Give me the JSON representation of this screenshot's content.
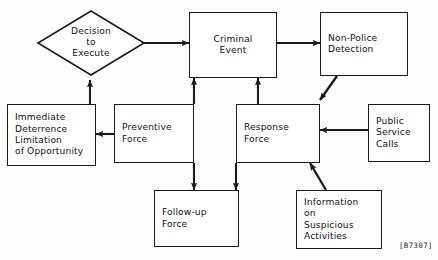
{
  "diagram": {
    "caption": "[B7307]",
    "stroke_color": "#1a1a1a",
    "background_color": "#fdfdfc",
    "nodes": {
      "decision": {
        "label": "Decision\nto\nExecute",
        "shape": "diamond"
      },
      "criminal_event": {
        "label": "Criminal\nEvent",
        "shape": "rect"
      },
      "non_police_detection": {
        "label": "Non-Police\nDetection",
        "shape": "rect"
      },
      "immediate_deterrence": {
        "label": "Immediate\nDeterrence\nLimitation\nof Opportunity",
        "shape": "rect"
      },
      "preventive_force": {
        "label": "Preventive\nForce",
        "shape": "rect"
      },
      "response_force": {
        "label": "Response\nForce",
        "shape": "rect"
      },
      "public_service_calls": {
        "label": "Public\nService\nCalls",
        "shape": "rect"
      },
      "follow_up_force": {
        "label": "Follow-up\nForce",
        "shape": "rect"
      },
      "information_suspicious": {
        "label": "Information\non\nSuspicious\nActivities",
        "shape": "rect"
      }
    },
    "edges": [
      {
        "from": "decision",
        "to": "criminal_event",
        "style": "straight-right"
      },
      {
        "from": "criminal_event",
        "to": "non_police_detection",
        "style": "straight-right"
      },
      {
        "from": "non_police_detection",
        "to": "response_force",
        "style": "diagonal-down-left"
      },
      {
        "from": "public_service_calls",
        "to": "response_force",
        "style": "straight-left"
      },
      {
        "from": "information_suspicious",
        "to": "response_force",
        "style": "diagonal-up-left"
      },
      {
        "from": "preventive_force",
        "to": "immediate_deterrence",
        "style": "straight-left"
      },
      {
        "from": "immediate_deterrence",
        "to": "decision",
        "style": "straight-up"
      },
      {
        "from": "preventive_force",
        "to": "criminal_event",
        "style": "straight-up"
      },
      {
        "from": "response_force",
        "to": "criminal_event",
        "style": "straight-up"
      },
      {
        "from": "preventive_force",
        "to": "follow_up_force",
        "style": "straight-down"
      },
      {
        "from": "response_force",
        "to": "follow_up_force",
        "style": "straight-down"
      }
    ]
  }
}
